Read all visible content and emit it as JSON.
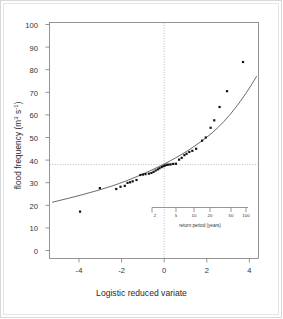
{
  "figure": {
    "title": "",
    "ylabel_text": "flood frequency (m",
    "ylabel_sup1": "3",
    "ylabel_mid": " s",
    "ylabel_sup2": "-1",
    "ylabel_end": ")",
    "xlabel": "Logistic reduced variate",
    "inset_caption": "return period (years)"
  },
  "chart_data": {
    "type": "scatter",
    "title": "",
    "xlabel": "Logistic reduced variate",
    "ylabel": "flood frequency (m3 s-1)",
    "xlim": [
      -5.0,
      4.8
    ],
    "ylim": [
      0,
      103
    ],
    "xticks": [
      -4,
      -2,
      0,
      2,
      4
    ],
    "yticks": [
      0,
      10,
      20,
      30,
      40,
      50,
      60,
      70,
      80,
      90,
      100
    ],
    "grid": false,
    "legend": "none",
    "reference_lines": [
      {
        "orientation": "vertical",
        "value": 0,
        "style": "dotted"
      },
      {
        "orientation": "horizontal",
        "value": 38,
        "style": "dotted"
      }
    ],
    "points": [
      {
        "x": -3.95,
        "y": 17.2
      },
      {
        "x": -3.02,
        "y": 27.6
      },
      {
        "x": -2.25,
        "y": 27.2
      },
      {
        "x": -2.05,
        "y": 28.2
      },
      {
        "x": -1.85,
        "y": 28.6
      },
      {
        "x": -1.72,
        "y": 29.9
      },
      {
        "x": -1.6,
        "y": 30.2
      },
      {
        "x": -1.48,
        "y": 30.6
      },
      {
        "x": -1.3,
        "y": 31.2
      },
      {
        "x": -1.12,
        "y": 33.4
      },
      {
        "x": -1.0,
        "y": 33.6
      },
      {
        "x": -0.88,
        "y": 33.8
      },
      {
        "x": -0.72,
        "y": 34.0
      },
      {
        "x": -0.6,
        "y": 34.3
      },
      {
        "x": -0.5,
        "y": 34.8
      },
      {
        "x": -0.4,
        "y": 35.4
      },
      {
        "x": -0.3,
        "y": 35.9
      },
      {
        "x": -0.22,
        "y": 36.4
      },
      {
        "x": -0.12,
        "y": 36.9
      },
      {
        "x": -0.04,
        "y": 37.3
      },
      {
        "x": 0.04,
        "y": 37.6
      },
      {
        "x": 0.12,
        "y": 37.9
      },
      {
        "x": 0.2,
        "y": 38.0
      },
      {
        "x": 0.3,
        "y": 38.1
      },
      {
        "x": 0.42,
        "y": 38.3
      },
      {
        "x": 0.55,
        "y": 38.4
      },
      {
        "x": 0.7,
        "y": 40.2
      },
      {
        "x": 0.82,
        "y": 41.0
      },
      {
        "x": 0.95,
        "y": 42.2
      },
      {
        "x": 1.05,
        "y": 42.8
      },
      {
        "x": 1.18,
        "y": 43.6
      },
      {
        "x": 1.32,
        "y": 44.1
      },
      {
        "x": 1.5,
        "y": 45.0
      },
      {
        "x": 1.78,
        "y": 48.6
      },
      {
        "x": 1.95,
        "y": 50.0
      },
      {
        "x": 2.18,
        "y": 54.3
      },
      {
        "x": 2.35,
        "y": 57.6
      },
      {
        "x": 2.6,
        "y": 63.5
      },
      {
        "x": 2.95,
        "y": 70.5
      },
      {
        "x": 3.7,
        "y": 83.4
      }
    ],
    "fit_curve": {
      "description": "fitted logistic/EV curve",
      "x_start": -4.55,
      "x_end": 4.45,
      "y_start": 21.3,
      "y_end": 93.5
    }
  },
  "yaxis": {
    "ticks": [
      {
        "label": "100",
        "value": 100
      },
      {
        "label": "90",
        "value": 90
      },
      {
        "label": "80",
        "value": 80
      },
      {
        "label": "70",
        "value": 70
      },
      {
        "label": "60",
        "value": 60
      },
      {
        "label": "50",
        "value": 50
      },
      {
        "label": "40",
        "value": 40
      },
      {
        "label": "30",
        "value": 30
      },
      {
        "label": "20",
        "value": 20
      },
      {
        "label": "10",
        "value": 10
      },
      {
        "label": "0",
        "value": 0
      }
    ]
  },
  "xaxis": {
    "ticks": [
      {
        "label": "-4",
        "value": -4
      },
      {
        "label": "-2",
        "value": -2
      },
      {
        "label": "0",
        "value": 0
      },
      {
        "label": "2",
        "value": 2
      },
      {
        "label": "4",
        "value": 4
      }
    ]
  },
  "inset_axis": {
    "caption": "return period (years)",
    "ticks": [
      {
        "label": "2",
        "value": 2
      },
      {
        "label": "5",
        "value": 5
      },
      {
        "label": "10",
        "value": 10
      },
      {
        "label": "20",
        "value": 20
      },
      {
        "label": "50",
        "value": 50
      },
      {
        "label": "100",
        "value": 100
      }
    ]
  },
  "colors": {
    "axis": "#6b6b6b",
    "text": "#2a2a2a",
    "point": "#111111",
    "curve": "#555555",
    "reference": "#aaaaaa",
    "page_border": "#d8d8d8"
  }
}
